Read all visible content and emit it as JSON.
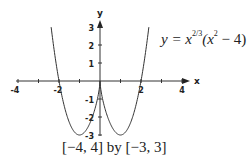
{
  "chart_data": {
    "type": "line",
    "title": "",
    "function": "y = x^(2/3) (x^2 - 4)",
    "xlabel": "x",
    "ylabel": "y",
    "xlim": [
      -4,
      4
    ],
    "ylim": [
      -3,
      3
    ],
    "x_ticks": [
      -4,
      -2,
      2,
      4
    ],
    "y_ticks": [
      3,
      2,
      1,
      -1,
      -2,
      -3
    ],
    "grid": false,
    "legend": null,
    "annotations": [
      "y = x^{2/3}(x^2 - 4)",
      "[-4, 4] by [-3, 3]"
    ],
    "series": [
      {
        "name": "y = x^(2/3)(x^2 - 4)",
        "x": [
          -2.6,
          -2.4,
          -2.2,
          -2.0,
          -1.8,
          -1.6,
          -1.4,
          -1.2,
          -1.0,
          -0.8,
          -0.6,
          -0.4,
          -0.2,
          0.0,
          0.2,
          0.4,
          0.6,
          0.8,
          1.0,
          1.2,
          1.4,
          1.6,
          1.8,
          2.0,
          2.2,
          2.4,
          2.6
        ],
        "values": [
          5.16,
          3.12,
          1.42,
          0.0,
          -1.12,
          -1.98,
          -2.56,
          -2.9,
          -3.0,
          -2.89,
          -2.58,
          -2.08,
          -1.36,
          0.0,
          -1.36,
          -2.08,
          -2.58,
          -2.89,
          -3.0,
          -2.9,
          -2.56,
          -1.98,
          -1.12,
          0.0,
          1.42,
          3.12,
          5.16
        ]
      }
    ]
  },
  "labels": {
    "x_axis": "x",
    "y_axis": "y",
    "x_ticks": [
      "-4",
      "-2",
      "2",
      "4"
    ],
    "y_ticks": [
      "3",
      "2",
      "1",
      "-1",
      "-2",
      "-3"
    ],
    "equation_base": "y = x",
    "equation_exp": "2/3",
    "equation_paren_open": "(x",
    "equation_sq": "2",
    "equation_rest": " − 4)",
    "window_caption": "[−4, 4] by [−3, 3]"
  }
}
